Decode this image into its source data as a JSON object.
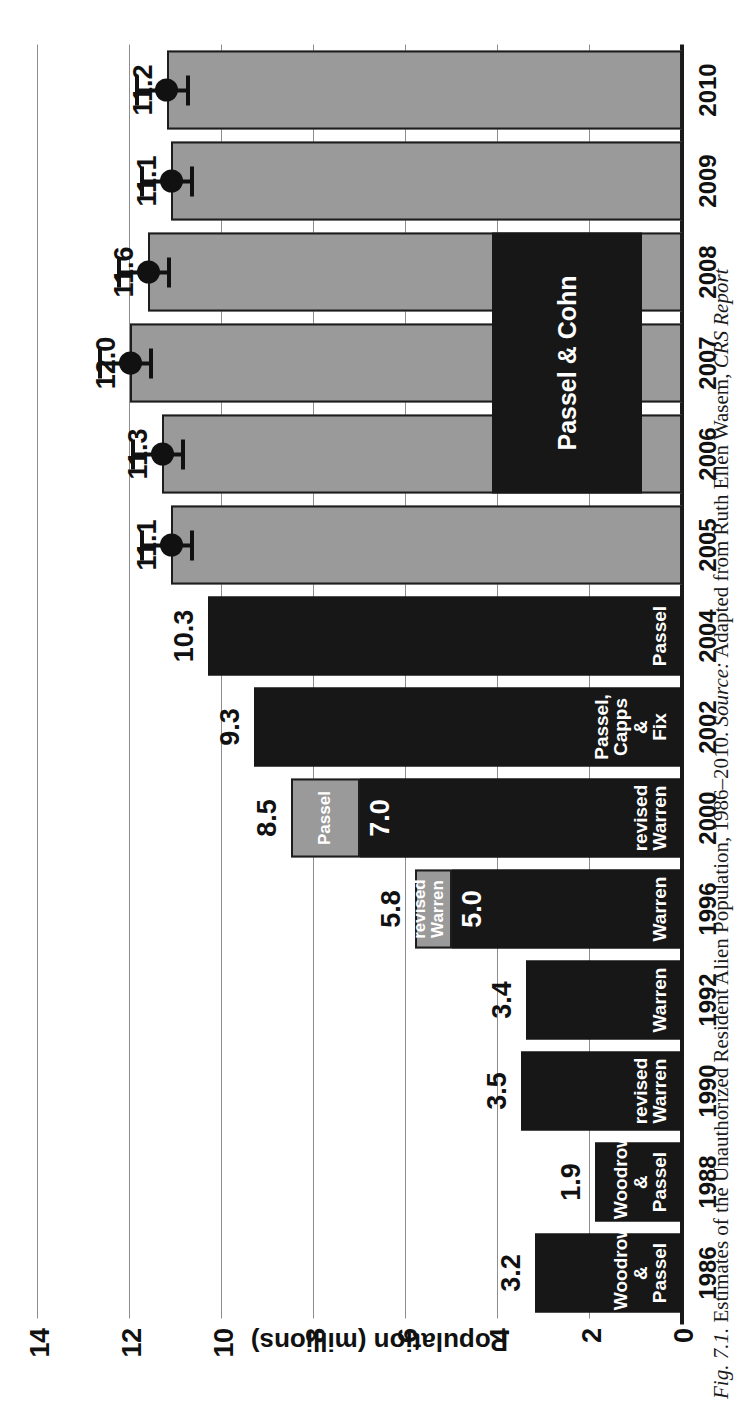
{
  "figure": {
    "caption_prefix": "Fig. 7.1.",
    "caption_main": " Estimates of the Unauthorized Resident Alien Population, 1986–2010. ",
    "caption_source_label": "Source:",
    "caption_source_text": " Adapted from Ruth Ellen Wasem, ",
    "caption_source_italic": "CRS Report"
  },
  "colors": {
    "dark_bar": "#171717",
    "gray_bar": "#9a9a9a",
    "gridline": "#8d8d8d",
    "axis": "#1a1a1a",
    "text": "#111111",
    "label_text": "#ffffff"
  },
  "chart_data": {
    "type": "bar",
    "title": "Estimates of the Unauthorized Resident Alien Population, 1986–2010",
    "xlabel": "",
    "ylabel": "Population (millions)",
    "ylim": [
      0,
      14
    ],
    "yticks": [
      "14",
      "12",
      "10",
      "8",
      "6",
      "4",
      "2",
      "0"
    ],
    "ytick_values": [
      14,
      12,
      10,
      8,
      6,
      4,
      2,
      0
    ],
    "grid": true,
    "legend_position": "inside-bars",
    "categories": [
      "1986",
      "1988",
      "1990",
      "1992",
      "1996",
      "2000",
      "2002",
      "2004",
      "2005",
      "2006",
      "2007",
      "2008",
      "2009",
      "2010"
    ],
    "values": [
      3.2,
      1.9,
      3.5,
      3.4,
      5.8,
      8.5,
      9.3,
      10.3,
      11.1,
      11.3,
      12.0,
      11.6,
      11.1,
      11.2
    ],
    "bars": [
      {
        "year": "1986",
        "total": 3.2,
        "value_label": "3.2",
        "label_inside": false,
        "segments": [
          {
            "value": 3.2,
            "style": "dark",
            "source": "Woodrow\n& Passel",
            "source_lines": [
              "Woodrow",
              "& Passel"
            ]
          }
        ],
        "error": null
      },
      {
        "year": "1988",
        "total": 1.9,
        "value_label": "1.9",
        "label_inside": false,
        "segments": [
          {
            "value": 1.9,
            "style": "dark",
            "source": "Woodrow\n& Passel",
            "source_lines": [
              "Woodrow",
              "& Passel"
            ]
          }
        ],
        "error": null
      },
      {
        "year": "1990",
        "total": 3.5,
        "value_label": "3.5",
        "label_inside": false,
        "segments": [
          {
            "value": 3.5,
            "style": "dark",
            "source": "revised\nWarren",
            "source_lines": [
              "revised",
              "Warren"
            ]
          }
        ],
        "error": null
      },
      {
        "year": "1992",
        "total": 3.4,
        "value_label": "3.4",
        "label_inside": false,
        "segments": [
          {
            "value": 3.4,
            "style": "dark",
            "source": "Warren",
            "source_lines": [
              "Warren"
            ]
          }
        ],
        "error": null
      },
      {
        "year": "1996",
        "total": 5.8,
        "value_label": "5.8",
        "label_inside": false,
        "inner_label": "5.0",
        "segments": [
          {
            "value": 5.0,
            "style": "dark",
            "source": "Warren",
            "source_lines": [
              "Warren"
            ]
          },
          {
            "value": 0.8,
            "style": "gray",
            "source": "revised\nWarren",
            "source_lines": [
              "revised",
              "Warren"
            ]
          }
        ],
        "error": null
      },
      {
        "year": "2000",
        "total": 8.5,
        "value_label": "8.5",
        "label_inside": false,
        "inner_label": "7.0",
        "segments": [
          {
            "value": 7.0,
            "style": "dark",
            "source": "revised\nWarren",
            "source_lines": [
              "revised",
              "Warren"
            ]
          },
          {
            "value": 1.5,
            "style": "gray",
            "source": "Passel",
            "source_lines": [
              "Passel"
            ]
          }
        ],
        "error": null
      },
      {
        "year": "2002",
        "total": 9.3,
        "value_label": "9.3",
        "label_inside": false,
        "segments": [
          {
            "value": 9.3,
            "style": "dark",
            "source": "Passel,\nCapps &\nFix",
            "source_lines": [
              "Passel,",
              "Capps &",
              "Fix"
            ]
          }
        ],
        "error": null
      },
      {
        "year": "2004",
        "total": 10.3,
        "value_label": "10.3",
        "label_inside": false,
        "segments": [
          {
            "value": 10.3,
            "style": "dark",
            "source": "Passel",
            "source_lines": [
              "Passel"
            ]
          }
        ],
        "error": null
      },
      {
        "year": "2005",
        "total": 11.1,
        "value_label": "11.1",
        "label_inside": false,
        "segments": [
          {
            "value": 11.1,
            "style": "gray",
            "source": "",
            "source_lines": []
          }
        ],
        "error": {
          "low": 10.6,
          "high": 11.7
        }
      },
      {
        "year": "2006",
        "total": 11.3,
        "value_label": "11.3",
        "label_inside": false,
        "segments": [
          {
            "value": 11.3,
            "style": "gray",
            "source": "",
            "source_lines": []
          }
        ],
        "error": {
          "low": 10.8,
          "high": 11.9
        }
      },
      {
        "year": "2007",
        "total": 12.0,
        "value_label": "12.0",
        "label_inside": false,
        "segments": [
          {
            "value": 12.0,
            "style": "gray",
            "source": "",
            "source_lines": []
          }
        ],
        "error": {
          "low": 11.5,
          "high": 12.6
        }
      },
      {
        "year": "2008",
        "total": 11.6,
        "value_label": "11.6",
        "label_inside": false,
        "segments": [
          {
            "value": 11.6,
            "style": "gray",
            "source": "",
            "source_lines": []
          }
        ],
        "error": {
          "low": 11.1,
          "high": 12.2
        }
      },
      {
        "year": "2009",
        "total": 11.1,
        "value_label": "11.1",
        "label_inside": false,
        "segments": [
          {
            "value": 11.1,
            "style": "gray",
            "source": "",
            "source_lines": []
          }
        ],
        "error": {
          "low": 10.6,
          "high": 11.7
        }
      },
      {
        "year": "2010",
        "total": 11.2,
        "value_label": "11.2",
        "label_inside": false,
        "segments": [
          {
            "value": 11.2,
            "style": "gray",
            "source": "",
            "source_lines": []
          }
        ],
        "error": {
          "low": 10.7,
          "high": 11.8
        }
      }
    ],
    "annotations": [
      {
        "text": "Passel & Cohn",
        "covers": [
          "2006",
          "2007",
          "2008"
        ]
      }
    ]
  }
}
